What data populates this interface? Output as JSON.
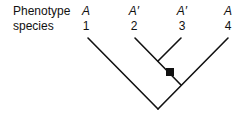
{
  "row_labels": {
    "phenotype": "Phenotype",
    "species": "species"
  },
  "taxa": [
    {
      "phenotype": "A",
      "species": "1"
    },
    {
      "phenotype": "A′",
      "species": "2"
    },
    {
      "phenotype": "A′",
      "species": "3"
    },
    {
      "phenotype": "A",
      "species": "4"
    }
  ],
  "tree": {
    "newick": "(1,((2,3),4));",
    "marker": {
      "shape": "filled-square",
      "branch": "stem of clade (2,3)",
      "meaning": "character change to A′"
    }
  },
  "colors": {
    "line": "#111111",
    "marker": "#111111",
    "background": "#ffffff"
  }
}
